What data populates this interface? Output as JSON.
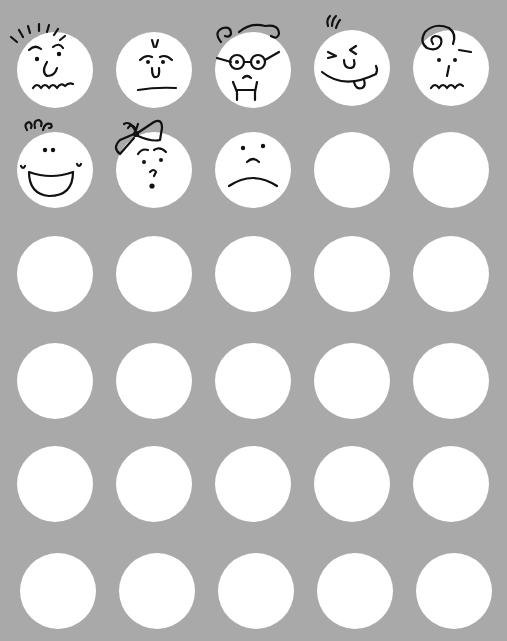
{
  "sheet": {
    "background": "#a9a9a9",
    "circle_color": "#ffffff",
    "rows": 6,
    "columns": 5,
    "circle_diameter": 76,
    "column_centers_x": [
      55,
      154,
      253,
      352,
      451
    ],
    "row_centers_y": [
      70,
      170,
      274,
      381,
      484,
      591
    ]
  },
  "faces": [
    {
      "row": 0,
      "col": 0,
      "icon": "spiky-hair-wavy-mouth-face-icon"
    },
    {
      "row": 0,
      "col": 1,
      "icon": "worried-flat-mouth-face-icon"
    },
    {
      "row": 0,
      "col": 2,
      "icon": "glasses-curly-hair-face-icon"
    },
    {
      "row": 0,
      "col": 3,
      "icon": "winking-tongue-out-face-icon"
    },
    {
      "row": 0,
      "col": 4,
      "icon": "dizzy-swirl-face-icon"
    },
    {
      "row": 1,
      "col": 0,
      "icon": "baby-laughing-face-icon"
    },
    {
      "row": 1,
      "col": 1,
      "icon": "bow-surprised-face-icon"
    },
    {
      "row": 1,
      "col": 2,
      "icon": "sad-frown-face-icon"
    }
  ]
}
